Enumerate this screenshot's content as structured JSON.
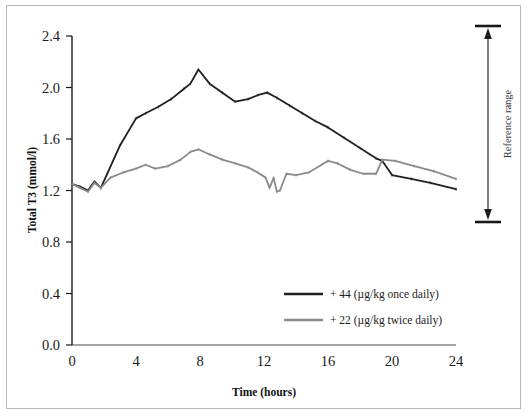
{
  "figure": {
    "name": "total-t3-vs-time-line-chart",
    "border_color": "#b9b9b9",
    "background": "#ffffff"
  },
  "chart_data": {
    "type": "line",
    "title": "",
    "xlabel": "Time (hours)",
    "ylabel": "Total T3   (mmol/l)",
    "xlim": [
      0,
      24
    ],
    "ylim": [
      0.0,
      2.4
    ],
    "xticks": [
      "0",
      "4",
      "8",
      "12",
      "16",
      "20",
      "24"
    ],
    "xtick_values": [
      0,
      4,
      8,
      12,
      16,
      20,
      24
    ],
    "yticks": [
      "0.0",
      "0.4",
      "0.8",
      "1.2",
      "1.6",
      "2.0",
      "2.4"
    ],
    "ytick_values": [
      0.0,
      0.4,
      0.8,
      1.2,
      1.6,
      2.0,
      2.4
    ],
    "grid": false,
    "legend_position": "lower-right-inside",
    "series": [
      {
        "name": "+ 44 (µg/kg once daily)",
        "color": "#1f1f1f",
        "linewidth": 1.8,
        "x": [
          0.0,
          0.5,
          1.0,
          1.4,
          1.8,
          2.2,
          3.0,
          4.0,
          4.6,
          5.4,
          6.2,
          7.0,
          7.4,
          7.9,
          8.6,
          9.4,
          10.2,
          11.0,
          11.6,
          12.2,
          12.8,
          13.6,
          14.4,
          15.2,
          16.0,
          17.0,
          18.0,
          19.0,
          19.4,
          20.0,
          21.2,
          22.4,
          24.0
        ],
        "y": [
          1.25,
          1.23,
          1.2,
          1.27,
          1.22,
          1.33,
          1.55,
          1.76,
          1.8,
          1.85,
          1.91,
          1.99,
          2.03,
          2.14,
          2.03,
          1.96,
          1.89,
          1.91,
          1.94,
          1.96,
          1.92,
          1.86,
          1.8,
          1.74,
          1.69,
          1.61,
          1.53,
          1.45,
          1.43,
          1.32,
          1.29,
          1.26,
          1.21
        ]
      },
      {
        "name": "+ 22 (µg/kg twice daily)",
        "color": "#8a8a8a",
        "linewidth": 1.8,
        "x": [
          0.0,
          0.5,
          1.0,
          1.4,
          1.8,
          2.4,
          3.2,
          4.0,
          4.6,
          5.2,
          6.0,
          6.8,
          7.4,
          7.9,
          8.6,
          9.4,
          10.2,
          11.0,
          11.6,
          12.1,
          12.35,
          12.6,
          12.8,
          13.0,
          13.4,
          14.0,
          14.8,
          15.6,
          16.0,
          16.6,
          17.4,
          18.2,
          19.0,
          19.4,
          20.2,
          21.4,
          22.6,
          24.0
        ],
        "y": [
          1.25,
          1.22,
          1.19,
          1.26,
          1.22,
          1.3,
          1.34,
          1.37,
          1.4,
          1.37,
          1.39,
          1.44,
          1.5,
          1.52,
          1.48,
          1.44,
          1.41,
          1.38,
          1.34,
          1.3,
          1.22,
          1.3,
          1.19,
          1.2,
          1.33,
          1.32,
          1.34,
          1.4,
          1.43,
          1.41,
          1.36,
          1.33,
          1.33,
          1.44,
          1.43,
          1.39,
          1.35,
          1.29
        ]
      }
    ],
    "annotations": [
      {
        "name": "reference-range",
        "label": "Reference range",
        "orientation": "vertical",
        "arrow": "double-headed",
        "top_value": 2.53,
        "bottom_value": 1.05
      }
    ]
  }
}
